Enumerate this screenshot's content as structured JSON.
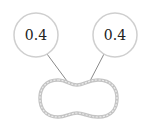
{
  "nodes": [
    {
      "id": "left",
      "label": "0.4",
      "cx": 36,
      "cy": 35,
      "r": 22
    },
    {
      "id": "right",
      "label": "0.4",
      "cx": 115,
      "cy": 35,
      "r": 22
    }
  ],
  "colors": {
    "node_stroke": "#cfcfcf",
    "edge_stroke": "#8a8a8a",
    "blob_stroke": "#c4c4c4",
    "blob_inner": "#ececec",
    "text": "#222222"
  }
}
